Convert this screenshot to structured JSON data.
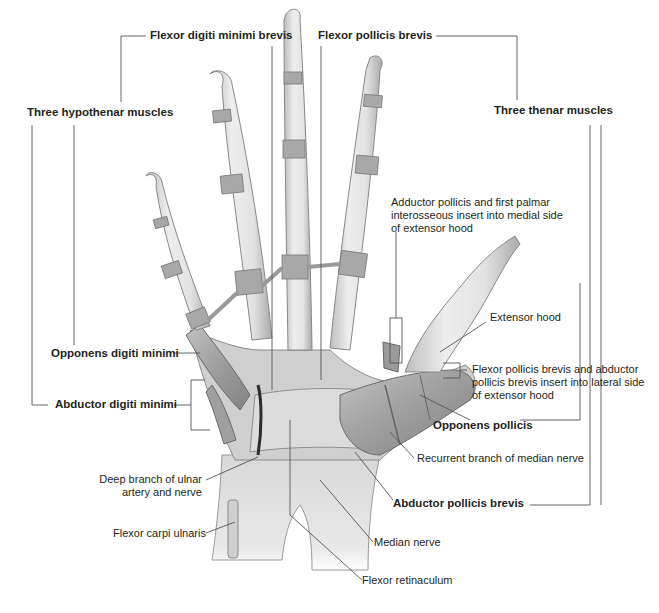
{
  "figure": {
    "colors": {
      "bone": "#e6e6e6",
      "bone_shade": "#b8b8b8",
      "muscle": "#a8a8a8",
      "muscle_dark": "#7c7c7c",
      "nerve_dark": "#2b2b2b",
      "leader_line": "#555555",
      "text": "#231f20",
      "background": "#ffffff"
    }
  },
  "labels": {
    "flexor_digiti_minimi_brevis": "Flexor digiti minimi brevis",
    "flexor_pollicis_brevis": "Flexor pollicis brevis",
    "three_hypothenar_muscles": "Three hypothenar muscles",
    "three_thenar_muscles": "Three thenar muscles",
    "adductor_pollicis_insert": "Adductor pollicis and first palmar interosseous insert into medial side of extensor hood",
    "extensor_hood": "Extensor hood",
    "fpb_apb_insert": "Flexor pollicis brevis and abductor pollicis brevis insert into lateral side of extensor hood",
    "opponens_digiti_minimi": "Opponens digiti minimi",
    "abductor_digiti_minimi": "Abductor digiti minimi",
    "opponens_pollicis": "Opponens pollicis",
    "recurrent_branch": "Recurrent branch of median nerve",
    "deep_branch_ulnar": "Deep branch of ulnar artery and nerve",
    "abductor_pollicis_brevis": "Abductor pollicis brevis",
    "flexor_carpi_ulnaris": "Flexor carpi ulnaris",
    "median_nerve": "Median nerve",
    "flexor_retinaculum": "Flexor retinaculum"
  }
}
